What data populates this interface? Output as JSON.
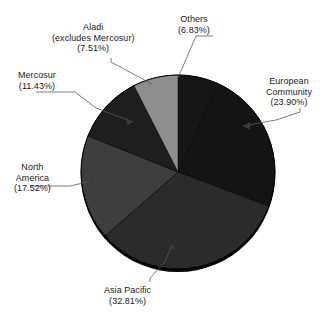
{
  "chart_data": {
    "type": "pie",
    "title": "",
    "subtitle": "",
    "xlabel": "",
    "ylabel": "",
    "legend_position": "none",
    "grid": false,
    "start_angle_deg": 0,
    "direction": "clockwise",
    "categories": [
      "Others",
      "European Community",
      "Asia Pacific",
      "North America",
      "Mercosur",
      "Aladi (excludes Mercosur)"
    ],
    "values": [
      6.83,
      23.9,
      32.81,
      17.52,
      11.43,
      7.51
    ],
    "value_unit": "%",
    "slices": [
      {
        "name": "Others",
        "value": 6.83,
        "value_text": "(6.83%)",
        "color": "#161616",
        "label_lines": [
          "Others",
          "(6.83%)"
        ]
      },
      {
        "name": "European Community",
        "value": 23.9,
        "value_text": "(23.90%)",
        "color": "#141414",
        "label_lines": [
          "European",
          "Community",
          "(23.90%)"
        ]
      },
      {
        "name": "Asia Pacific",
        "value": 32.81,
        "value_text": "(32.81%)",
        "color": "#2b2b2b",
        "label_lines": [
          "Asia Pacific",
          "(32.81%)"
        ]
      },
      {
        "name": "North America",
        "value": 17.52,
        "value_text": "(17.52%)",
        "color": "#3e3e3e",
        "label_lines": [
          "North",
          "America",
          "(17.52%)"
        ]
      },
      {
        "name": "Mercosur",
        "value": 11.43,
        "value_text": "(11.43%)",
        "color": "#1e1e1e",
        "label_lines": [
          "Mercosur",
          "(11.43%)"
        ]
      },
      {
        "name": "Aladi (excludes Mercosur)",
        "value": 7.51,
        "value_text": "(7.51%)",
        "color": "#8e8e8e",
        "label_lines": [
          "Aladi",
          "(excludes Mercosur)",
          "(7.51%)"
        ]
      }
    ]
  },
  "labels": {
    "others": {
      "l1": "Others",
      "l2": "(6.83%)"
    },
    "aladi": {
      "l1": "Aladi",
      "l2": "(excludes Mercosur)",
      "l3": "(7.51%)"
    },
    "mercosur": {
      "l1": "Mercosur",
      "l2": "(11.43%)"
    },
    "european": {
      "l1": "European",
      "l2": "Community",
      "l3": "(23.90%)"
    },
    "north_america": {
      "l1": "North",
      "l2": "America",
      "l3": "(17.52%)"
    },
    "asia_pacific": {
      "l1": "Asia Pacific",
      "l2": "(32.81%)"
    }
  },
  "colors": {
    "background": "#ffffff",
    "text": "#1a1a1a",
    "leader_line": "#5a5a5a",
    "pie_edge": "#000000"
  }
}
